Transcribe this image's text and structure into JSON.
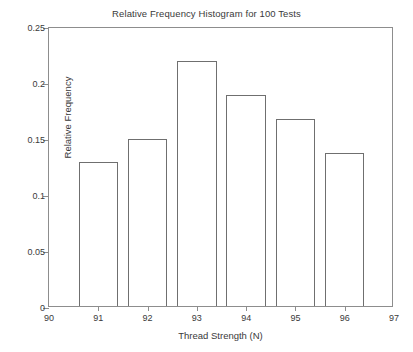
{
  "chart_data": {
    "type": "bar",
    "title": "Relative Frequency Histogram for 100 Tests",
    "xlabel": "Thread Strength (N)",
    "ylabel": "Relative Frequency",
    "categories": [
      "91",
      "92",
      "93",
      "94",
      "95",
      "96"
    ],
    "bin_edges": [
      90.6,
      91.4,
      91.6,
      92.4,
      92.6,
      93.4,
      93.6,
      94.4,
      94.6,
      95.4,
      95.6,
      96.4
    ],
    "bins": [
      {
        "label": "91",
        "center": 91,
        "left": 90.6,
        "right": 91.4,
        "value": 0.129
      },
      {
        "label": "92",
        "center": 92,
        "left": 91.6,
        "right": 92.4,
        "value": 0.149
      },
      {
        "label": "93",
        "center": 93,
        "left": 92.6,
        "right": 93.4,
        "value": 0.219
      },
      {
        "label": "94",
        "center": 94,
        "left": 93.6,
        "right": 94.4,
        "value": 0.188
      },
      {
        "label": "95",
        "center": 95,
        "left": 94.6,
        "right": 95.4,
        "value": 0.167
      },
      {
        "label": "96",
        "center": 96,
        "left": 95.6,
        "right": 96.4,
        "value": 0.137
      }
    ],
    "values": [
      0.129,
      0.149,
      0.219,
      0.188,
      0.167,
      0.137
    ],
    "xlim": [
      90,
      97
    ],
    "ylim": [
      0,
      0.25
    ],
    "xticks": [
      "90",
      "91",
      "92",
      "93",
      "94",
      "95",
      "96",
      "97"
    ],
    "xtick_values": [
      90,
      91,
      92,
      93,
      94,
      95,
      96,
      97
    ],
    "yticks": [
      "0",
      "0.05",
      "0.1",
      "0.15",
      "0.2",
      "0.25"
    ],
    "ytick_values": [
      0,
      0.05,
      0.1,
      0.15,
      0.2,
      0.25
    ],
    "grid": false,
    "legend": null,
    "bar_fill_color": "#ffffff",
    "bar_edge_color": "#6f6f6f",
    "axis_color": "#8d8d8d",
    "background_color": "#ffffff",
    "text_color": "#3a3a3a"
  }
}
